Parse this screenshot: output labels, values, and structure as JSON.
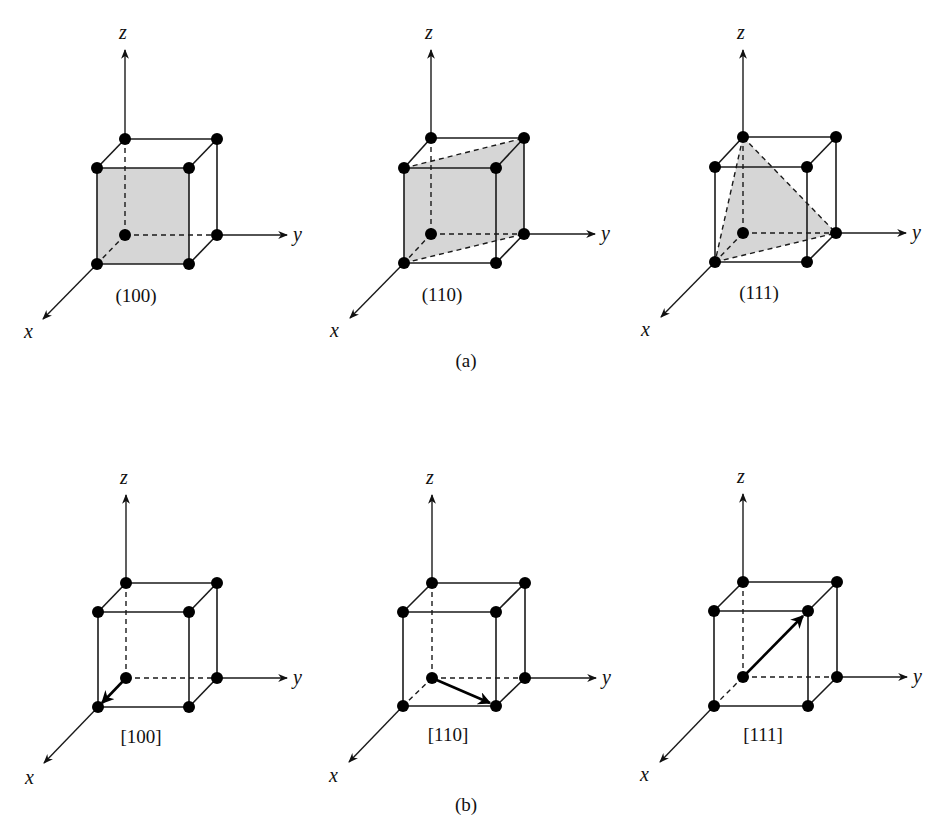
{
  "figure": {
    "panels": [
      {
        "id": "a",
        "caption": "(a)",
        "kind": "planes",
        "cells": [
          {
            "label": "(100)",
            "highlight": "plane-100"
          },
          {
            "label": "(110)",
            "highlight": "plane-110"
          },
          {
            "label": "(111)",
            "highlight": "plane-111"
          }
        ]
      },
      {
        "id": "b",
        "caption": "(b)",
        "kind": "directions",
        "cells": [
          {
            "label": "[100]",
            "highlight": "vector-100"
          },
          {
            "label": "[110]",
            "highlight": "vector-110"
          },
          {
            "label": "[111]",
            "highlight": "vector-111"
          }
        ]
      }
    ],
    "axes": {
      "x": "x",
      "y": "y",
      "z": "z"
    },
    "colors": {
      "line": "#1a1a1a",
      "atom": "#000000",
      "plane_fill": "#d6d6d6",
      "background": "#ffffff"
    }
  }
}
